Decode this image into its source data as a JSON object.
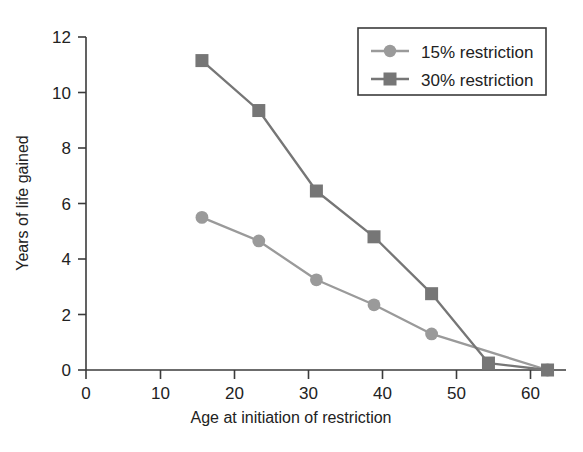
{
  "chart_data": {
    "type": "line",
    "title": "",
    "xlabel": "Age at initiation of restriction",
    "ylabel": "Years of life gained",
    "xlim": [
      0,
      65
    ],
    "ylim": [
      0,
      12
    ],
    "xticks": [
      0,
      10,
      20,
      30,
      40,
      50,
      60
    ],
    "yticks": [
      0,
      2,
      4,
      6,
      8,
      10,
      12
    ],
    "xtick_labels": [
      "0",
      "10",
      "20",
      "30",
      "40",
      "50",
      "60"
    ],
    "ytick_labels": [
      "0",
      "2",
      "4",
      "6",
      "8",
      "10",
      "12"
    ],
    "grid": false,
    "legend_position": "top-right",
    "series": [
      {
        "name": "15% restriction",
        "color": "#9a9a9a",
        "marker": "circle",
        "x": [
          15.7,
          23.4,
          31.2,
          39.0,
          46.8,
          62.5
        ],
        "values": [
          5.5,
          4.65,
          3.25,
          2.35,
          1.3,
          0.0
        ]
      },
      {
        "name": "30% restriction",
        "color": "#767676",
        "marker": "square",
        "x": [
          15.7,
          23.4,
          31.2,
          39.0,
          46.8,
          54.5,
          62.5
        ],
        "values": [
          11.15,
          9.35,
          6.45,
          4.8,
          2.75,
          0.25,
          0.0
        ]
      }
    ]
  },
  "legend": {
    "entries": [
      {
        "label": "15% restriction"
      },
      {
        "label": "30% restriction"
      }
    ]
  },
  "caption": {
    "text": ""
  },
  "colors": {
    "series_light": "#9a9a9a",
    "series_dark": "#767676",
    "axis": "#3b3b3b",
    "text": "#222222",
    "background": "#ffffff"
  }
}
